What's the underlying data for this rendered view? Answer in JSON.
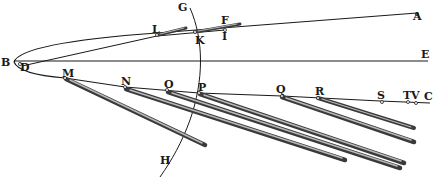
{
  "figure": {
    "type": "geometric-diagram",
    "colors": {
      "ink": "#1a1a1a",
      "tail": "#3a3a3a",
      "background": "#ffffff"
    },
    "labels": {
      "A": "A",
      "B": "B",
      "C": "C",
      "D": "D",
      "E": "E",
      "F": "F",
      "G": "G",
      "H": "H",
      "I": "I",
      "K": "K",
      "L": "L",
      "M": "M",
      "N": "N",
      "O": "O",
      "P": "P",
      "Q": "Q",
      "R": "R",
      "S": "S",
      "T": "T",
      "V": "V"
    }
  }
}
